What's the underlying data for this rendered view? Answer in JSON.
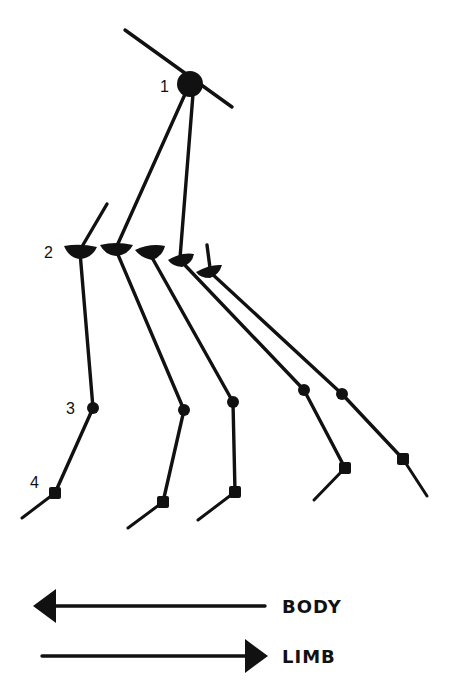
{
  "diagram": {
    "type": "limb-posture-sequence",
    "joint_labels": [
      {
        "id": "1",
        "text": "1",
        "x": 165,
        "y": 90
      },
      {
        "id": "2",
        "text": "2",
        "x": 44,
        "y": 258
      },
      {
        "id": "3",
        "text": "3",
        "x": 66,
        "y": 414
      },
      {
        "id": "4",
        "text": "4",
        "x": 30,
        "y": 488
      }
    ],
    "hip": {
      "x": 190,
      "y": 84,
      "r": 13
    },
    "pelvis_line": {
      "x1": 125,
      "y1": 30,
      "x2": 232,
      "y2": 107
    },
    "limbs": [
      {
        "name": "limb-a",
        "top": [
          107,
          204
        ],
        "knee": [
          80,
          250
        ],
        "ankle": [
          93,
          408
        ],
        "foot": [
          55,
          493
        ],
        "toe": [
          22,
          518
        ],
        "knee_angle": 0
      },
      {
        "name": "limb-b",
        "top": [
          190,
          86
        ],
        "knee": [
          116,
          248
        ],
        "ankle": [
          184,
          410
        ],
        "foot": [
          163,
          502
        ],
        "toe": [
          128,
          528
        ],
        "knee_angle": 5
      },
      {
        "name": "limb-c",
        "top": null,
        "knee": [
          150,
          252
        ],
        "ankle": [
          233,
          402
        ],
        "foot": [
          235,
          492
        ],
        "toe": [
          198,
          520
        ],
        "knee_angle": 10
      },
      {
        "name": "limb-d",
        "top": [
          190,
          90
        ],
        "knee": [
          180,
          258
        ],
        "ankle": [
          304,
          390
        ],
        "foot": [
          345,
          468
        ],
        "toe": [
          314,
          500
        ],
        "knee_angle": -15
      },
      {
        "name": "limb-e",
        "top": [
          207,
          245
        ],
        "knee": [
          210,
          270
        ],
        "ankle": [
          342,
          394
        ],
        "foot": [
          403,
          459
        ],
        "toe": [
          427,
          496
        ],
        "knee_angle": -20
      }
    ],
    "legend": [
      {
        "label": "BODY",
        "direction": "left",
        "x1": 35,
        "x2": 265,
        "y": 606
      },
      {
        "label": "LIMB",
        "direction": "right",
        "x1": 42,
        "x2": 266,
        "y": 656
      }
    ]
  }
}
